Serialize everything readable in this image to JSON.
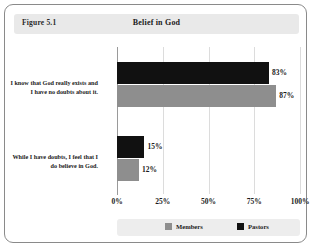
{
  "figure": {
    "number_label": "Figure 5.1",
    "title": "Belief in God"
  },
  "legend": {
    "entries": [
      {
        "label": "Members",
        "color": "#8e8e8e",
        "swatch_name": "legend-swatch-members"
      },
      {
        "label": "Pastors",
        "color": "#111111",
        "swatch_name": "legend-swatch-pastors"
      }
    ]
  },
  "axis": {
    "ticks": [
      "0%",
      "25%",
      "50%",
      "75%",
      "100%"
    ],
    "tick_values": [
      0,
      25,
      50,
      75,
      100
    ]
  },
  "categories": [
    "I know that God really exists and I have no doubts about it.",
    "While I have doubts, I feel that I do believe in God."
  ],
  "bars": [
    {
      "category_index": 0,
      "series": "Pastors",
      "value": 83,
      "label": "83%",
      "color": "#111111"
    },
    {
      "category_index": 0,
      "series": "Members",
      "value": 87,
      "label": "87%",
      "color": "#8e8e8e"
    },
    {
      "category_index": 1,
      "series": "Pastors",
      "value": 15,
      "label": "15%",
      "color": "#111111"
    },
    {
      "category_index": 1,
      "series": "Members",
      "value": 12,
      "label": "12%",
      "color": "#8e8e8e"
    }
  ],
  "chart_data": {
    "type": "bar",
    "orientation": "horizontal",
    "title": "Belief in God",
    "subtitle": "Figure 5.1",
    "xlabel": "",
    "ylabel": "",
    "xlim": [
      0,
      100
    ],
    "xticks": [
      0,
      25,
      50,
      75,
      100
    ],
    "xticklabels": [
      "0%",
      "25%",
      "50%",
      "75%",
      "100%"
    ],
    "grid": "vertical",
    "legend_position": "bottom",
    "value_labels": true,
    "categories": [
      "I know that God really exists and I have no doubts about it.",
      "While I have doubts, I feel that I do believe in God."
    ],
    "series": [
      {
        "name": "Pastors",
        "color": "#111111",
        "values": [
          83,
          15
        ],
        "value_labels": [
          "83%",
          "15%"
        ]
      },
      {
        "name": "Members",
        "color": "#8e8e8e",
        "values": [
          87,
          12
        ],
        "value_labels": [
          "87%",
          "12%"
        ]
      }
    ]
  }
}
